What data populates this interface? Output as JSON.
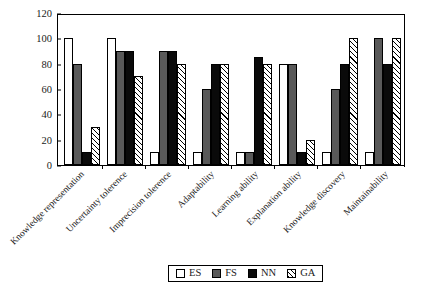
{
  "chart_data": {
    "type": "bar",
    "title": "",
    "xlabel": "",
    "ylabel": "",
    "ylim": [
      0,
      120
    ],
    "yticks": [
      0,
      20,
      40,
      60,
      80,
      100,
      120
    ],
    "grid": false,
    "legend_position": "bottom",
    "categories": [
      "Knowledge representation",
      "Uncertainty tolerence",
      "Imprecision tolerence",
      "Adaptability",
      "Learning ability",
      "Explanation ability",
      "Knowledge discovery",
      "Maintainability"
    ],
    "series": [
      {
        "name": "ES",
        "color": "#ffffff",
        "fill": "solid-white",
        "values": [
          100,
          100,
          10,
          10,
          10,
          80,
          10,
          10
        ]
      },
      {
        "name": "FS",
        "color": "#595959",
        "fill": "solid-gray",
        "values": [
          80,
          90,
          90,
          60,
          10,
          80,
          60,
          100
        ]
      },
      {
        "name": "NN",
        "color": "#0a0a0a",
        "fill": "solid-black",
        "values": [
          10,
          90,
          90,
          80,
          85,
          10,
          80,
          80
        ]
      },
      {
        "name": "GA",
        "color": "#ffffff",
        "fill": "diagonal-hatch",
        "values": [
          30,
          70,
          80,
          80,
          80,
          20,
          100,
          100
        ]
      }
    ]
  },
  "legend": {
    "items": [
      {
        "label": "ES",
        "swatch": "legend-swatch-es"
      },
      {
        "label": "FS",
        "swatch": "legend-swatch-fs"
      },
      {
        "label": "NN",
        "swatch": "legend-swatch-nn"
      },
      {
        "label": "GA",
        "swatch": "legend-swatch-ga"
      }
    ]
  }
}
